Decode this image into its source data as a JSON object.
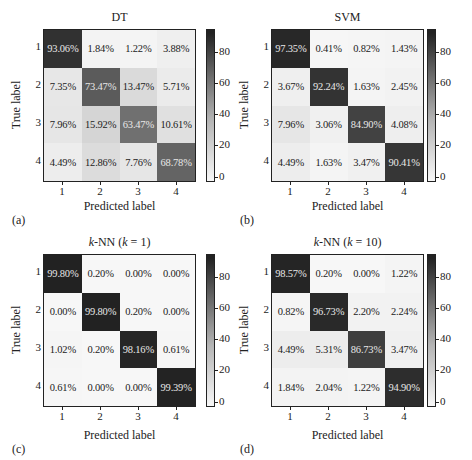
{
  "chart_data": [
    {
      "type": "heatmap",
      "panel_label": "(a)",
      "title": "DT",
      "xlabel": "Predicted label",
      "ylabel": "True label",
      "x_ticks": [
        "1",
        "2",
        "3",
        "4"
      ],
      "y_ticks": [
        "1",
        "2",
        "3",
        "4"
      ],
      "colorbar_ticks": [
        "80",
        "60",
        "40",
        "20",
        "0"
      ],
      "values": [
        [
          93.06,
          1.84,
          1.22,
          3.88
        ],
        [
          7.35,
          73.47,
          13.47,
          5.71
        ],
        [
          7.96,
          15.92,
          63.47,
          10.61
        ],
        [
          4.49,
          12.86,
          7.76,
          68.78
        ]
      ],
      "labels": [
        [
          "93.06%",
          "1.84%",
          "1.22%",
          "3.88%"
        ],
        [
          "7.35%",
          "73.47%",
          "13.47%",
          "5.71%"
        ],
        [
          "7.96%",
          "15.92%",
          "63.47%",
          "10.61%"
        ],
        [
          "4.49%",
          "12.86%",
          "7.76%",
          "68.78%"
        ]
      ]
    },
    {
      "type": "heatmap",
      "panel_label": "(b)",
      "title": "SVM",
      "xlabel": "Predicted label",
      "ylabel": "True label",
      "x_ticks": [
        "1",
        "2",
        "3",
        "4"
      ],
      "y_ticks": [
        "1",
        "2",
        "3",
        "4"
      ],
      "colorbar_ticks": [
        "80",
        "60",
        "40",
        "20",
        "0"
      ],
      "values": [
        [
          97.35,
          0.41,
          0.82,
          1.43
        ],
        [
          3.67,
          92.24,
          1.63,
          2.45
        ],
        [
          7.96,
          3.06,
          84.9,
          4.08
        ],
        [
          4.49,
          1.63,
          3.47,
          90.41
        ]
      ],
      "labels": [
        [
          "97.35%",
          "0.41%",
          "0.82%",
          "1.43%"
        ],
        [
          "3.67%",
          "92.24%",
          "1.63%",
          "2.45%"
        ],
        [
          "7.96%",
          "3.06%",
          "84.90%",
          "4.08%"
        ],
        [
          "4.49%",
          "1.63%",
          "3.47%",
          "90.41%"
        ]
      ]
    },
    {
      "type": "heatmap",
      "panel_label": "(c)",
      "title_prefix": "k",
      "title_mid": "-NN (",
      "title_k": "k",
      "title_suffix": " = 1)",
      "title": "k-NN (k = 1)",
      "xlabel": "Predicted label",
      "ylabel": "True label",
      "x_ticks": [
        "1",
        "2",
        "3",
        "4"
      ],
      "y_ticks": [
        "1",
        "2",
        "3",
        "4"
      ],
      "colorbar_ticks": [
        "80",
        "60",
        "40",
        "20",
        "0"
      ],
      "values": [
        [
          99.8,
          0.2,
          0.0,
          0.0
        ],
        [
          0.0,
          99.8,
          0.2,
          0.0
        ],
        [
          1.02,
          0.2,
          98.16,
          0.61
        ],
        [
          0.61,
          0.0,
          0.0,
          99.39
        ]
      ],
      "labels": [
        [
          "99.80%",
          "0.20%",
          "0.00%",
          "0.00%"
        ],
        [
          "0.00%",
          "99.80%",
          "0.20%",
          "0.00%"
        ],
        [
          "1.02%",
          "0.20%",
          "98.16%",
          "0.61%"
        ],
        [
          "0.61%",
          "0.00%",
          "0.00%",
          "99.39%"
        ]
      ]
    },
    {
      "type": "heatmap",
      "panel_label": "(d)",
      "title_prefix": "k",
      "title_mid": "-NN (",
      "title_k": "k",
      "title_suffix": " = 10)",
      "title": "k-NN (k = 10)",
      "xlabel": "Predicted label",
      "ylabel": "True label",
      "x_ticks": [
        "1",
        "2",
        "3",
        "4"
      ],
      "y_ticks": [
        "1",
        "2",
        "3",
        "4"
      ],
      "colorbar_ticks": [
        "80",
        "60",
        "40",
        "20",
        "0"
      ],
      "values": [
        [
          98.57,
          0.2,
          0.0,
          1.22
        ],
        [
          0.82,
          96.73,
          2.2,
          2.24
        ],
        [
          4.49,
          5.31,
          86.73,
          3.47
        ],
        [
          1.84,
          2.04,
          1.22,
          94.9
        ]
      ],
      "labels": [
        [
          "98.57%",
          "0.20%",
          "0.00%",
          "1.22%"
        ],
        [
          "0.82%",
          "96.73%",
          "2.20%",
          "2.24%"
        ],
        [
          "4.49%",
          "5.31%",
          "86.73%",
          "3.47%"
        ],
        [
          "1.84%",
          "2.04%",
          "1.22%",
          "94.90%"
        ]
      ]
    }
  ],
  "colormap": {
    "min_color": "#f7f7f7",
    "max_color": "#222222",
    "min": 0,
    "max": 100
  }
}
